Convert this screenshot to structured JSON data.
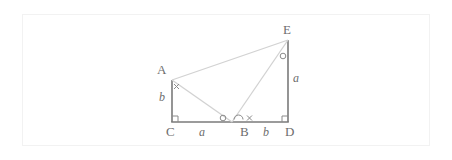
{
  "figure": {
    "canvas": {
      "width": 452,
      "height": 160
    },
    "frame": {
      "x": 22,
      "y": 14,
      "width": 408,
      "height": 132,
      "color": "#f2f2f2"
    },
    "stroke_color": "#7a7a7a",
    "light_stroke_color": "#cfcfcf",
    "label_color": "#6d6d6d",
    "points": {
      "A": {
        "x": 172,
        "y": 80
      },
      "B": {
        "x": 232,
        "y": 122
      },
      "C": {
        "x": 172,
        "y": 122
      },
      "D": {
        "x": 288,
        "y": 122
      },
      "E": {
        "x": 288,
        "y": 40
      }
    },
    "vertex_labels": [
      {
        "name": "A",
        "text": "A",
        "x": 159,
        "y": 66
      },
      {
        "name": "E",
        "text": "E",
        "x": 283,
        "y": 25
      },
      {
        "name": "C",
        "text": "C",
        "x": 166,
        "y": 126
      },
      {
        "name": "B",
        "text": "B",
        "x": 240,
        "y": 126
      },
      {
        "name": "D",
        "text": "D",
        "x": 285,
        "y": 126
      }
    ],
    "side_labels": [
      {
        "name": "side-b-left",
        "text": "b",
        "x": 159,
        "y": 92
      },
      {
        "name": "side-a-bottom",
        "text": "a",
        "x": 199,
        "y": 126
      },
      {
        "name": "side-b-bottom",
        "text": "b",
        "x": 262,
        "y": 126
      },
      {
        "name": "side-a-right",
        "text": "a",
        "x": 292,
        "y": 72
      }
    ],
    "angle_marks": [
      {
        "name": "cross-mark-at-A",
        "symbol": "x",
        "x": 176,
        "y": 85
      },
      {
        "name": "circle-mark-left-of-B",
        "symbol": "o",
        "x": 222,
        "y": 117
      },
      {
        "name": "arc-mark-at-B",
        "symbol": "arc",
        "x": 238,
        "y": 117
      },
      {
        "name": "cross-mark-right-of-B",
        "symbol": "x",
        "x": 250,
        "y": 117
      },
      {
        "name": "circle-mark-at-E",
        "symbol": "o",
        "x": 282,
        "y": 55
      }
    ],
    "right_angles": [
      {
        "name": "right-angle-at-C",
        "x": 172,
        "y": 122
      },
      {
        "name": "right-angle-at-D",
        "x": 288,
        "y": 122
      }
    ],
    "segments": [
      {
        "name": "segment-AC",
        "from": "A",
        "to": "C",
        "weight": "heavy"
      },
      {
        "name": "segment-CD",
        "from": "C",
        "to": "D",
        "weight": "heavy"
      },
      {
        "name": "segment-DE",
        "from": "D",
        "to": "E",
        "weight": "heavy"
      },
      {
        "name": "segment-AE",
        "from": "A",
        "to": "E",
        "weight": "light"
      },
      {
        "name": "segment-AB",
        "from": "A",
        "to": "B",
        "weight": "light"
      },
      {
        "name": "segment-BE",
        "from": "B",
        "to": "E",
        "weight": "light"
      }
    ]
  }
}
